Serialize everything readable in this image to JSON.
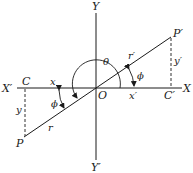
{
  "diagram": {
    "type": "trigonometric-reference-angle",
    "colors": {
      "ink": "#1a1a1a",
      "background": "#ffffff"
    },
    "axes": {
      "x_positive": "X",
      "x_negative": "X′",
      "y_positive": "Y",
      "y_negative": "Y′",
      "origin": "O"
    },
    "points": {
      "P": "P",
      "P_prime": "P′",
      "C": "C",
      "C_prime": "C′"
    },
    "segments": {
      "x": "x",
      "y": "y",
      "r": "r",
      "x_prime": "x′",
      "y_prime": "y′",
      "r_prime": "r′"
    },
    "angles": {
      "theta": "θ",
      "phi_left": "ϕ",
      "phi_right": "ϕ"
    }
  }
}
